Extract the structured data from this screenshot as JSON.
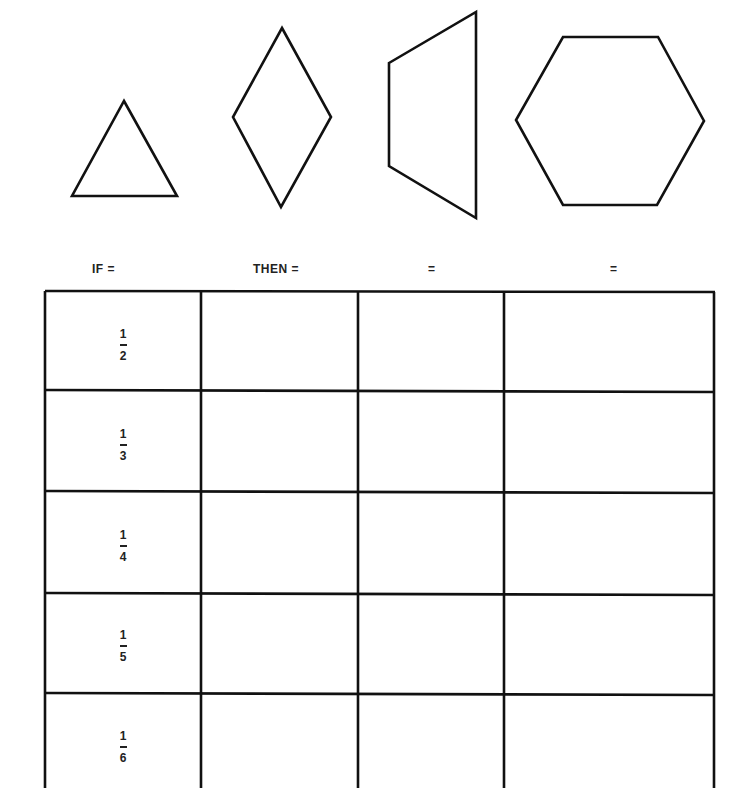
{
  "shapes": [
    {
      "name": "triangle",
      "points": "124,101 177,196 72,196"
    },
    {
      "name": "rhombus",
      "points": "282,28 331,117 281,207 233,117"
    },
    {
      "name": "trapezoid",
      "points": "389,63 476,12 476,218 389,166"
    },
    {
      "name": "hexagon",
      "points": "563,37 658,37 704,121 657,205 563,205 516,120"
    }
  ],
  "header": {
    "col1": "IF =",
    "col2": "THEN =",
    "col3": "=",
    "col4": "="
  },
  "table": {
    "rows": [
      {
        "numerator": "1",
        "denominator": "2"
      },
      {
        "numerator": "1",
        "denominator": "3"
      },
      {
        "numerator": "1",
        "denominator": "4"
      },
      {
        "numerator": "1",
        "denominator": "5"
      },
      {
        "numerator": "1",
        "denominator": "6"
      }
    ]
  }
}
